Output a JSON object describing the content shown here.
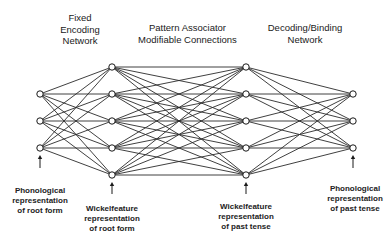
{
  "titles": {
    "encoding": "Fixed\nEncoding\nNetwork",
    "pattern": "Pattern Associator\nModifiable Connections",
    "decoding": "Decoding/Binding\nNetwork"
  },
  "captions": {
    "input_phon": "Phonological\nrepresentation\nof root form",
    "input_wickel": "Wickelfeature\nrepresentation\nof root form",
    "output_wickel": "Wickelfeature\nrepresentation\nof past tense",
    "output_phon": "Phonological\nrepresentation\nof past tense"
  },
  "network": {
    "layers": [
      {
        "name": "phonological-root",
        "x": 40,
        "ys": [
          94,
          121,
          148
        ]
      },
      {
        "name": "wickelfeature-root",
        "x": 112,
        "ys": [
          67,
          94,
          121,
          148,
          175
        ]
      },
      {
        "name": "wickelfeature-past",
        "x": 246,
        "ys": [
          67,
          94,
          121,
          148,
          175
        ]
      },
      {
        "name": "phonological-past",
        "x": 353,
        "ys": [
          94,
          121,
          148
        ]
      }
    ],
    "arrows": [
      {
        "x": 40,
        "y1": 168,
        "y2": 155
      },
      {
        "x": 112,
        "y1": 194,
        "y2": 182
      },
      {
        "x": 246,
        "y1": 194,
        "y2": 182
      },
      {
        "x": 353,
        "y1": 168,
        "y2": 155
      }
    ],
    "node_radius": 3.2,
    "line_color": "#2a2a2a",
    "node_stroke": "#1a1a1a",
    "node_fill": "#ffffff"
  }
}
